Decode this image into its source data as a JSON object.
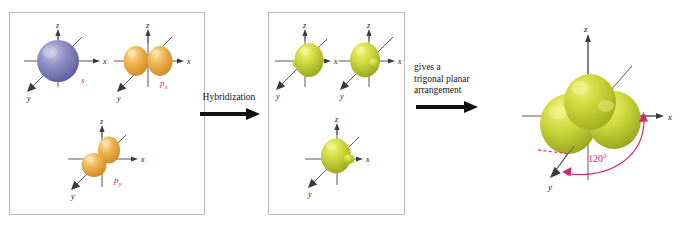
{
  "figure": {
    "background_color": "#ffffff",
    "panel_border_color": "#b9b9bd"
  },
  "colors": {
    "s_orbital": "#7b7bb5",
    "p_orbital": "#e8a93d",
    "hybrid_orbital": "#c8d432",
    "axis": "#58585c",
    "label_accent": "#d6266e",
    "arrow": "#111114",
    "text": "#131316"
  },
  "axes": {
    "z": "z",
    "x": "x",
    "y": "y"
  },
  "panels": [
    {
      "id": "atomic-orbitals",
      "name": "atomic-orbitals-panel",
      "orbitals": [
        {
          "id": "s",
          "label": "s",
          "sub": "",
          "type": "sphere",
          "color": "#7b7bb5"
        },
        {
          "id": "px",
          "label": "p",
          "sub": "x",
          "type": "dumbbell",
          "color": "#e8a93d"
        },
        {
          "id": "py",
          "label": "p",
          "sub": "y",
          "type": "dumbbell",
          "color": "#e8a93d"
        }
      ]
    },
    {
      "id": "hybrid-orbitals",
      "name": "hybrid-orbitals-panel",
      "orbitals": [
        {
          "id": "hybrid-1",
          "label": "",
          "sub": "",
          "type": "hybrid",
          "color": "#c8d432"
        },
        {
          "id": "hybrid-2",
          "label": "",
          "sub": "",
          "type": "hybrid",
          "color": "#c8d432"
        },
        {
          "id": "hybrid-3",
          "label": "",
          "sub": "",
          "type": "hybrid",
          "color": "#c8d432"
        }
      ]
    }
  ],
  "steps": [
    {
      "id": "hybridization",
      "lines": [
        "Hybridization"
      ],
      "arrow": "right-arrow"
    },
    {
      "id": "trigonal-planar",
      "lines": [
        "gives a",
        "trigonal planar",
        "arrangement"
      ],
      "arrow": "right-arrow"
    }
  ],
  "result": {
    "id": "trigonal-planar-result",
    "name": "trigonal-planar-orbital-set",
    "angle_label": "120°",
    "lobe_count": 3,
    "color": "#c8d432"
  }
}
